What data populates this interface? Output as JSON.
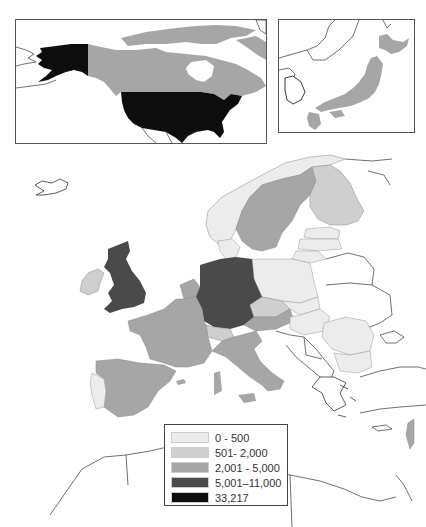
{
  "map": {
    "type": "choropleth",
    "insets": [
      {
        "name": "North America",
        "regions": [
          {
            "country": "United States",
            "class": 4
          },
          {
            "country": "Canada",
            "class": 2
          }
        ]
      },
      {
        "name": "Japan",
        "regions": [
          {
            "country": "Japan",
            "class": 2
          }
        ]
      }
    ],
    "europe_regions": [
      {
        "country": "United Kingdom",
        "class": 3
      },
      {
        "country": "Germany",
        "class": 3
      },
      {
        "country": "Ireland",
        "class": 1
      },
      {
        "country": "France",
        "class": 2
      },
      {
        "country": "Spain",
        "class": 2
      },
      {
        "country": "Italy",
        "class": 2
      },
      {
        "country": "Sweden",
        "class": 2
      },
      {
        "country": "Netherlands",
        "class": 2
      },
      {
        "country": "Belgium",
        "class": 2
      },
      {
        "country": "Austria",
        "class": 2
      },
      {
        "country": "Israel",
        "class": 2
      },
      {
        "country": "Finland",
        "class": 1
      },
      {
        "country": "Switzerland",
        "class": 1
      },
      {
        "country": "Czech Republic",
        "class": 1
      },
      {
        "country": "Denmark",
        "class": 0
      },
      {
        "country": "Norway",
        "class": 0
      },
      {
        "country": "Portugal",
        "class": 0
      },
      {
        "country": "Poland",
        "class": 0
      },
      {
        "country": "Estonia",
        "class": 0
      },
      {
        "country": "Latvia",
        "class": 0
      },
      {
        "country": "Lithuania",
        "class": 0
      },
      {
        "country": "Slovakia",
        "class": 0
      },
      {
        "country": "Hungary",
        "class": 0
      },
      {
        "country": "Romania",
        "class": 0
      },
      {
        "country": "Bulgaria",
        "class": 0
      },
      {
        "country": "Slovenia",
        "class": 0
      }
    ]
  },
  "legend": {
    "items": [
      {
        "label": "0 - 500",
        "color": "#ececec"
      },
      {
        "label": "501- 2,000",
        "color": "#cfcfcf"
      },
      {
        "label": "2,001 - 5,000",
        "color": "#a6a6a6"
      },
      {
        "label": "5,001–11,000",
        "color": "#4a4a4a"
      },
      {
        "label": "33,217",
        "color": "#0d0d0d"
      }
    ]
  }
}
